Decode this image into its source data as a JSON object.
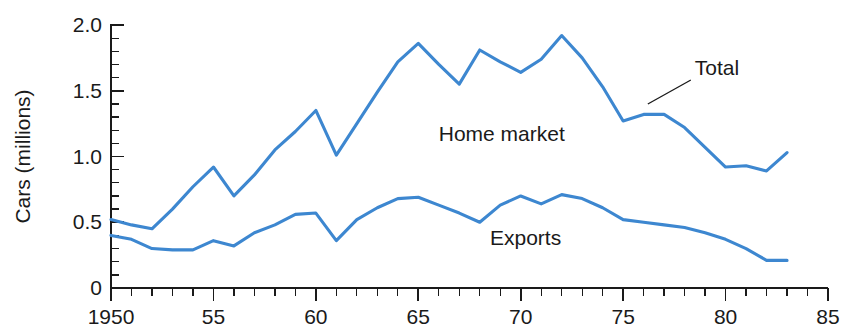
{
  "chart_data": {
    "type": "line",
    "title": "",
    "xlabel": "",
    "ylabel": "Cars (millions)",
    "xlim": [
      1950,
      1985
    ],
    "ylim": [
      0,
      2.0
    ],
    "grid": false,
    "legend_position": "inline-annotations",
    "x_tick_labels": [
      "1950",
      "55",
      "60",
      "65",
      "70",
      "75",
      "80",
      "85"
    ],
    "x_tick_values": [
      1950,
      1955,
      1960,
      1965,
      1970,
      1975,
      1980,
      1985
    ],
    "x_minor_tick_step": 1,
    "y_tick_labels": [
      "0",
      "0.5",
      "1.0",
      "1.5",
      "2.0"
    ],
    "y_tick_values": [
      0,
      0.5,
      1.0,
      1.5,
      2.0
    ],
    "y_minor_tick_step": 0.1,
    "series_color": "#3d87d0",
    "x": [
      1950,
      1951,
      1952,
      1953,
      1954,
      1955,
      1956,
      1957,
      1958,
      1959,
      1960,
      1961,
      1962,
      1963,
      1964,
      1965,
      1966,
      1967,
      1968,
      1969,
      1970,
      1971,
      1972,
      1973,
      1974,
      1975,
      1976,
      1977,
      1978,
      1979,
      1980,
      1981,
      1982,
      1983
    ],
    "series": [
      {
        "name": "Total",
        "label": "Total",
        "values": [
          0.52,
          0.48,
          0.45,
          0.6,
          0.77,
          0.92,
          0.7,
          0.86,
          1.05,
          1.19,
          1.35,
          1.01,
          1.25,
          1.49,
          1.72,
          1.86,
          1.7,
          1.55,
          1.81,
          1.72,
          1.64,
          1.74,
          1.92,
          1.75,
          1.53,
          1.27,
          1.32,
          1.32,
          1.22,
          1.07,
          0.92,
          0.93,
          0.89,
          1.03
        ]
      },
      {
        "name": "Exports",
        "label": "Exports",
        "values": [
          0.4,
          0.37,
          0.3,
          0.29,
          0.29,
          0.36,
          0.32,
          0.42,
          0.48,
          0.56,
          0.57,
          0.36,
          0.52,
          0.61,
          0.68,
          0.69,
          0.63,
          0.57,
          0.5,
          0.63,
          0.7,
          0.64,
          0.71,
          0.68,
          0.61,
          0.52,
          0.5,
          0.48,
          0.46,
          0.42,
          0.37,
          0.3,
          0.21,
          0.21
        ]
      }
    ],
    "annotations": [
      {
        "text": "Home market",
        "x_value": 1966.0,
        "y_value": 1.12,
        "has_leader": false
      },
      {
        "text": "Exports",
        "x_value": 1968.5,
        "y_value": 0.33,
        "has_leader": false
      },
      {
        "text": "Total",
        "x_value": 1978.5,
        "y_value": 1.62,
        "has_leader": true
      }
    ]
  }
}
